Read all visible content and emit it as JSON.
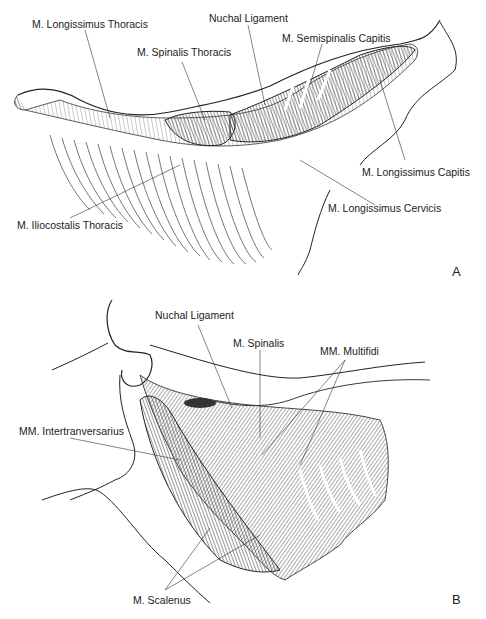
{
  "panels": [
    {
      "id": "A",
      "letter": "A",
      "labels": [
        {
          "text": "M. Longissimus Thoracis"
        },
        {
          "text": "Nuchal Ligament"
        },
        {
          "text": "M. Spinalis Thoracis"
        },
        {
          "text": "M. Semispinalis Capitis"
        },
        {
          "text": "M. Longissimus Capitis"
        },
        {
          "text": "M. Longissimus Cervicis"
        },
        {
          "text": "M. Iliocostalis Thoracis"
        }
      ]
    },
    {
      "id": "B",
      "letter": "B",
      "labels": [
        {
          "text": "Nuchal Ligament"
        },
        {
          "text": "M. Spinalis"
        },
        {
          "text": "MM. Multifidi"
        },
        {
          "text": "MM. Intertranversarius"
        },
        {
          "text": "M. Scalenus"
        }
      ]
    }
  ],
  "colors": {
    "ink": "#222222",
    "background": "#ffffff",
    "shade": "#555555"
  }
}
